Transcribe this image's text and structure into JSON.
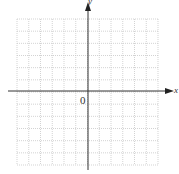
{
  "diagram": {
    "type": "coordinate-grid",
    "grid": {
      "cells_x": 12,
      "cells_y": 12,
      "left": 17,
      "top": 19,
      "right": 158,
      "bottom": 165,
      "line_color": "#c8c8c8",
      "line_style": "dotted"
    },
    "axes": {
      "origin_px": [
        88,
        91
      ],
      "color": "#333333",
      "x_label": "x",
      "y_label": "y",
      "origin_label": "0"
    }
  }
}
